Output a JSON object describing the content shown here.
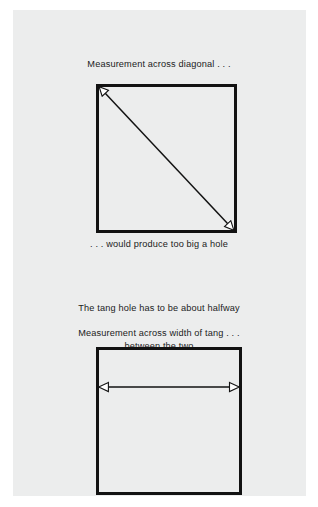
{
  "figure": {
    "kind": "technical-illustration",
    "background_color": "#ffffff",
    "page_color": "#eceded",
    "ink_color": "#121212"
  },
  "captions": {
    "diagonal": "Measurement across diagonal . . .",
    "too_big": ". . . would produce too big a hole",
    "halfway_line1": "The tang hole has to be about halfway",
    "halfway_line2": "between the two",
    "width": "Measurement across width of tang . . ."
  },
  "diagrams": [
    {
      "id": "square-diagonal",
      "shape": "square",
      "outline_color": "#121212",
      "annotation": "double-headed arrow drawn corner to corner along the diagonal",
      "arrow": {
        "type": "double-headed",
        "orientation": "diagonal",
        "from": "top-left",
        "to": "bottom-right"
      }
    },
    {
      "id": "square-width",
      "shape": "square",
      "outline_color": "#121212",
      "annotation": "double-headed arrow drawn horizontally across the width",
      "arrow": {
        "type": "double-headed",
        "orientation": "horizontal",
        "from": "left-edge",
        "to": "right-edge"
      }
    }
  ]
}
